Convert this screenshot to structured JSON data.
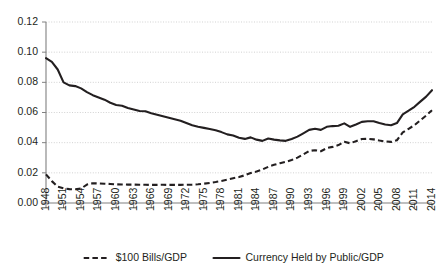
{
  "chart_data": {
    "type": "line",
    "title": "",
    "subtitle": "",
    "xlabel": "",
    "ylabel": "",
    "xlim": [
      1948,
      2014
    ],
    "ylim": [
      0.0,
      0.12
    ],
    "grid": true,
    "grid_axis": "y",
    "legend_position": "bottom",
    "y_ticks": [
      "0.00",
      "0.02",
      "0.04",
      "0.06",
      "0.08",
      "0.10",
      "0.12"
    ],
    "y_tick_values": [
      0.0,
      0.02,
      0.04,
      0.06,
      0.08,
      0.1,
      0.12
    ],
    "x_ticks": [
      "1948",
      "1951",
      "1954",
      "1957",
      "1960",
      "1963",
      "1966",
      "1969",
      "1972",
      "1975",
      "1978",
      "1981",
      "1984",
      "1987",
      "1990",
      "1993",
      "1996",
      "1999",
      "2002",
      "2005",
      "2008",
      "2011",
      "2014"
    ],
    "x_tick_values": [
      1948,
      1951,
      1954,
      1957,
      1960,
      1963,
      1966,
      1969,
      1972,
      1975,
      1978,
      1981,
      1984,
      1987,
      1990,
      1993,
      1996,
      1999,
      2002,
      2005,
      2008,
      2011,
      2014
    ],
    "x": [
      1948,
      1949,
      1950,
      1951,
      1952,
      1953,
      1954,
      1955,
      1956,
      1957,
      1958,
      1959,
      1960,
      1961,
      1962,
      1963,
      1964,
      1965,
      1966,
      1967,
      1968,
      1969,
      1970,
      1971,
      1972,
      1973,
      1974,
      1975,
      1976,
      1977,
      1978,
      1979,
      1980,
      1981,
      1982,
      1983,
      1984,
      1985,
      1986,
      1987,
      1988,
      1989,
      1990,
      1991,
      1992,
      1993,
      1994,
      1995,
      1996,
      1997,
      1998,
      1999,
      2000,
      2001,
      2002,
      2003,
      2004,
      2005,
      2006,
      2007,
      2008,
      2009,
      2010,
      2011,
      2012,
      2013,
      2014
    ],
    "series": [
      {
        "name": "$100 Bills/GDP",
        "style": "dashed",
        "color": "#231f20",
        "values": [
          0.019,
          0.0145,
          0.0108,
          0.0097,
          0.0092,
          0.0091,
          0.0096,
          0.0122,
          0.0131,
          0.013,
          0.0128,
          0.0126,
          0.0124,
          0.0123,
          0.0122,
          0.0122,
          0.0121,
          0.0121,
          0.012,
          0.012,
          0.0121,
          0.012,
          0.012,
          0.012,
          0.0121,
          0.0122,
          0.0124,
          0.0128,
          0.0133,
          0.0139,
          0.0146,
          0.0155,
          0.0164,
          0.0172,
          0.0184,
          0.0199,
          0.0209,
          0.0222,
          0.024,
          0.0253,
          0.0264,
          0.0273,
          0.0285,
          0.0301,
          0.0322,
          0.0345,
          0.035,
          0.0343,
          0.0364,
          0.0372,
          0.0384,
          0.0406,
          0.0396,
          0.041,
          0.0424,
          0.0426,
          0.0422,
          0.0414,
          0.0408,
          0.0405,
          0.0416,
          0.0468,
          0.0492,
          0.0516,
          0.0548,
          0.058,
          0.0615
        ]
      },
      {
        "name": "Currency Held by Public/GDP",
        "style": "solid",
        "color": "#231f20",
        "values": [
          0.096,
          0.0935,
          0.0885,
          0.08,
          0.078,
          0.0775,
          0.076,
          0.0735,
          0.0715,
          0.07,
          0.0685,
          0.0665,
          0.065,
          0.0645,
          0.063,
          0.062,
          0.061,
          0.0608,
          0.0595,
          0.0585,
          0.0575,
          0.0565,
          0.0555,
          0.0545,
          0.053,
          0.0515,
          0.0505,
          0.0498,
          0.049,
          0.0482,
          0.047,
          0.0455,
          0.0448,
          0.0432,
          0.0425,
          0.0435,
          0.042,
          0.0412,
          0.0428,
          0.042,
          0.0415,
          0.0412,
          0.0425,
          0.044,
          0.0462,
          0.0485,
          0.0492,
          0.0485,
          0.0505,
          0.051,
          0.0512,
          0.0528,
          0.0505,
          0.052,
          0.0538,
          0.0542,
          0.0542,
          0.053,
          0.052,
          0.0515,
          0.053,
          0.0588,
          0.0612,
          0.0638,
          0.0672,
          0.0705,
          0.0748
        ]
      }
    ]
  },
  "legend": {
    "items": [
      {
        "label": "$100 Bills/GDP",
        "style": "dashed"
      },
      {
        "label": "Currency Held by Public/GDP",
        "style": "solid"
      }
    ]
  }
}
